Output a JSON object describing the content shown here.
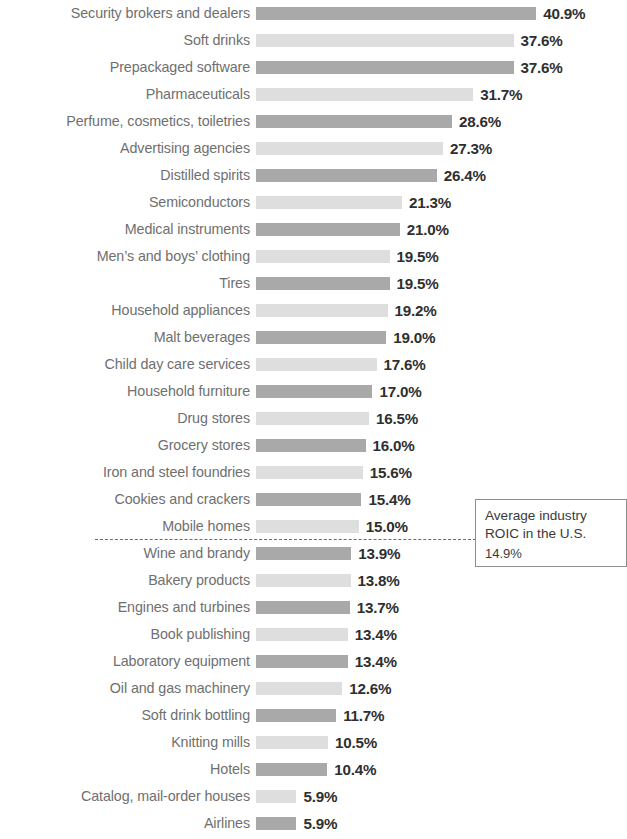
{
  "chart_data": {
    "type": "bar",
    "orientation": "horizontal",
    "title": "",
    "subtitle": "",
    "xlabel": "",
    "ylabel": "",
    "grid": false,
    "legend": null,
    "xlim": [
      0,
      40.9
    ],
    "value_suffix": "%",
    "categories": [
      "Security brokers and dealers",
      "Soft drinks",
      "Prepackaged software",
      "Pharmaceuticals",
      "Perfume, cosmetics, toiletries",
      "Advertising agencies",
      "Distilled spirits",
      "Semiconductors",
      "Medical instruments",
      "Men’s and boys’ clothing",
      "Tires",
      "Household appliances",
      "Malt beverages",
      "Child day care services",
      "Household furniture",
      "Drug stores",
      "Grocery stores",
      "Iron and steel foundries",
      "Cookies and crackers",
      "Mobile homes",
      "Wine and brandy",
      "Bakery products",
      "Engines and turbines",
      "Book publishing",
      "Laboratory equipment",
      "Oil and gas machinery",
      "Soft drink bottling",
      "Knitting mills",
      "Hotels",
      "Catalog, mail-order houses",
      "Airlines"
    ],
    "values": [
      40.9,
      37.6,
      37.6,
      31.7,
      28.6,
      27.3,
      26.4,
      21.3,
      21.0,
      19.5,
      19.5,
      19.2,
      19.0,
      17.6,
      17.0,
      16.5,
      16.0,
      15.6,
      15.4,
      15.0,
      13.9,
      13.8,
      13.7,
      13.4,
      13.4,
      12.6,
      11.7,
      10.5,
      10.4,
      5.9,
      5.9
    ],
    "value_labels": [
      "40.9%",
      "37.6%",
      "37.6%",
      "31.7%",
      "28.6%",
      "27.3%",
      "26.4%",
      "21.3%",
      "21.0%",
      "19.5%",
      "19.5%",
      "19.2%",
      "19.0%",
      "17.6%",
      "17.0%",
      "16.5%",
      "16.0%",
      "15.6%",
      "15.4%",
      "15.0%",
      "13.9%",
      "13.8%",
      "13.7%",
      "13.4%",
      "13.4%",
      "12.6%",
      "11.7%",
      "10.5%",
      "10.4%",
      "5.9%",
      "5.9%"
    ],
    "bar_colors": {
      "dark": "#a9a9a9",
      "light": "#dedede"
    },
    "label_color": "#6f6f6f",
    "value_color": "#2f2f2f",
    "annotation": {
      "line1": "Average industry",
      "line2": "ROIC in the U.S.",
      "value": "14.9%",
      "reference_value": 14.9,
      "line_style": "dashed",
      "line_color": "#6a6a6a",
      "box_border_color": "#8d8d8d"
    }
  }
}
